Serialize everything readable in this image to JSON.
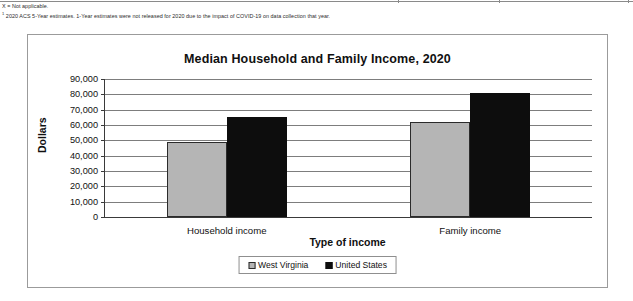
{
  "footnotes": [
    "X = Not applicable.",
    "2020 ACS 5-Year estimates. 1-Year estimates were not released for 2020 due to the impact of COVID-19 on data collection that year."
  ],
  "footnote_markers": {
    "second": "1"
  },
  "chart_data": {
    "type": "bar",
    "title": "Median Household and Family Income, 2020",
    "xlabel": "Type of income",
    "ylabel": "Dollars",
    "categories": [
      "Household income",
      "Family income"
    ],
    "series": [
      {
        "name": "West Virginia",
        "values": [
          49000,
          62000
        ],
        "color": "#b5b5b5"
      },
      {
        "name": "United States",
        "values": [
          65000,
          81000
        ],
        "color": "#0d0d0d"
      }
    ],
    "ylim": [
      0,
      90000
    ],
    "ytick_values": [
      0,
      10000,
      20000,
      30000,
      40000,
      50000,
      60000,
      70000,
      80000,
      90000
    ],
    "ytick_labels": [
      "0",
      "10,000",
      "20,000",
      "30,000",
      "40,000",
      "50,000",
      "60,000",
      "70,000",
      "80,000",
      "90,000"
    ],
    "grid": true,
    "legend_position": "bottom-center"
  }
}
